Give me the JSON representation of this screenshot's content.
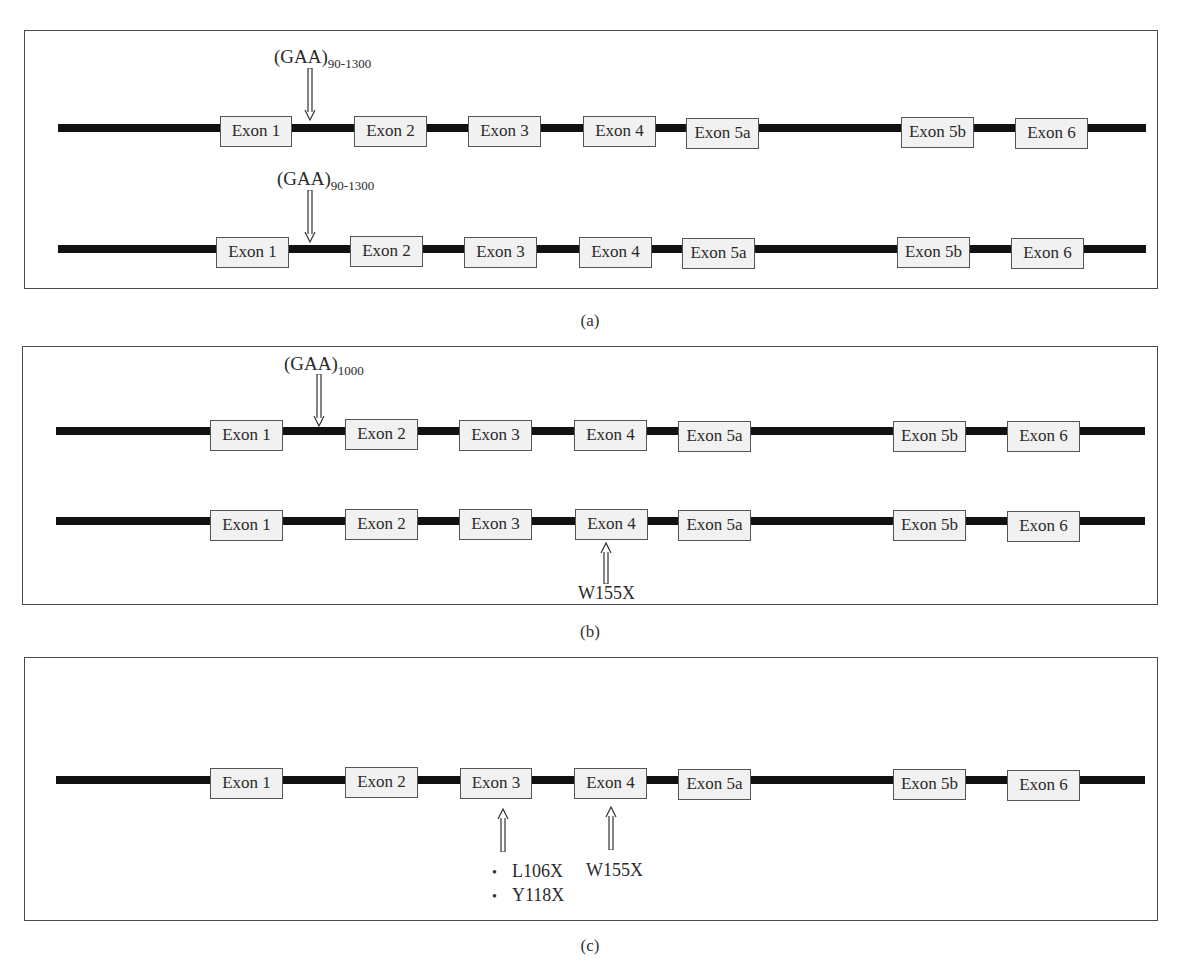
{
  "figure": {
    "panels": [
      {
        "id": "a",
        "caption": "(a)",
        "rows": [
          {
            "repeat_label": {
              "base": "(GAA)",
              "sub": "90-1300"
            },
            "exons": [
              "Exon 1",
              "Exon 2",
              "Exon 3",
              "Exon 4",
              "Exon 5a",
              "Exon 5b",
              "Exon 6"
            ]
          },
          {
            "repeat_label": {
              "base": "(GAA)",
              "sub": "90-1300"
            },
            "exons": [
              "Exon 1",
              "Exon 2",
              "Exon 3",
              "Exon 4",
              "Exon 5a",
              "Exon 5b",
              "Exon 6"
            ]
          }
        ]
      },
      {
        "id": "b",
        "caption": "(b)",
        "rows": [
          {
            "repeat_label": {
              "base": "(GAA)",
              "sub": "1000"
            },
            "exons": [
              "Exon 1",
              "Exon 2",
              "Exon 3",
              "Exon 4",
              "Exon 5a",
              "Exon 5b",
              "Exon 6"
            ]
          },
          {
            "mutation": "W155X",
            "mutation_exon": "Exon 4",
            "exons": [
              "Exon 1",
              "Exon 2",
              "Exon 3",
              "Exon 4",
              "Exon 5a",
              "Exon 5b",
              "Exon 6"
            ]
          }
        ]
      },
      {
        "id": "c",
        "caption": "(c)",
        "rows": [
          {
            "exons": [
              "Exon 1",
              "Exon 2",
              "Exon 3",
              "Exon 4",
              "Exon 5a",
              "Exon 5b",
              "Exon 6"
            ],
            "mutations": [
              {
                "exon": "Exon 3",
                "labels": [
                  "L106X",
                  "Y118X"
                ],
                "bulleted": true
              },
              {
                "exon": "Exon 4",
                "labels": [
                  "W155X"
                ],
                "bulleted": false
              }
            ]
          }
        ]
      }
    ]
  },
  "colors": {
    "gene_line": "#111111",
    "exon_fill": "#f1f1f1",
    "exon_border": "#555555",
    "panel_border": "#4a4a4a",
    "text": "#2a2a2a"
  }
}
